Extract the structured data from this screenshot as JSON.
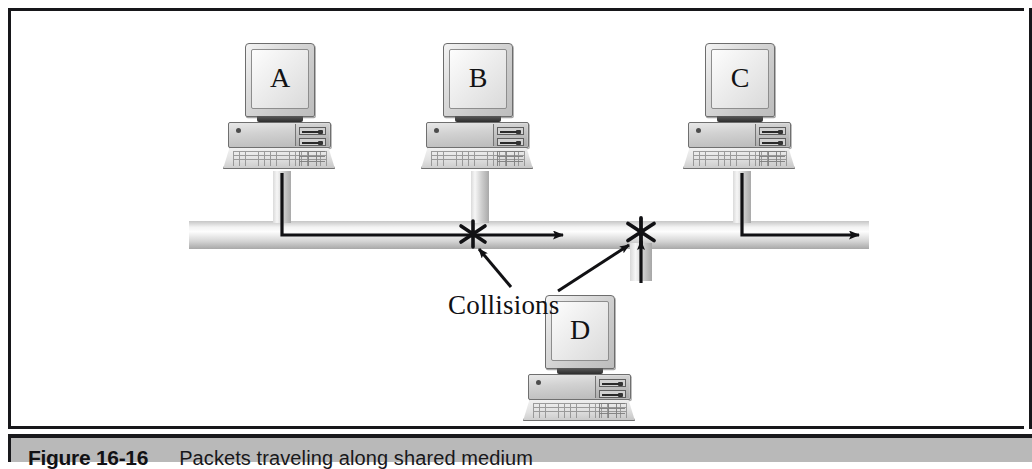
{
  "figure": {
    "caption_number": "Figure 16-16",
    "caption_text": "Packets traveling along shared medium",
    "frame_border_color": "#17171a",
    "caption_band_color": "#b9b9b9"
  },
  "diagram": {
    "title_label": "Collisions",
    "bus_label": "shared medium bus",
    "workstations": [
      {
        "id": "A",
        "screen_letter": "A",
        "x": 212,
        "y": 32,
        "orientation": "upright"
      },
      {
        "id": "B",
        "screen_letter": "B",
        "x": 410,
        "y": 32,
        "orientation": "upright"
      },
      {
        "id": "C",
        "screen_letter": "C",
        "x": 672,
        "y": 32,
        "orientation": "upright"
      },
      {
        "id": "D",
        "screen_letter": "D",
        "x": 512,
        "y": 266,
        "orientation": "inverted"
      }
    ],
    "drop_cables": [
      {
        "for": "A",
        "x": 262,
        "y": 160,
        "height": 52
      },
      {
        "for": "B",
        "x": 460,
        "y": 160,
        "height": 52
      },
      {
        "for": "C",
        "x": 722,
        "y": 160,
        "height": 52
      },
      {
        "for": "D",
        "x": 619,
        "y": 232,
        "height": 38
      }
    ],
    "collision_markers": [
      {
        "name": "collision-star-1",
        "x": 462,
        "y": 222
      },
      {
        "name": "collision-star-2",
        "x": 630,
        "y": 220
      }
    ],
    "packet_paths": [
      {
        "from": "A",
        "description": "down drop cable then right along bus"
      },
      {
        "from": "C",
        "description": "down drop cable then right to bus end"
      },
      {
        "from": "D",
        "description": "up drop cable into bus"
      }
    ],
    "arrowheads": [
      {
        "name": "arrow-bus-mid",
        "x": 560,
        "y": 224,
        "direction": "right"
      },
      {
        "name": "arrow-bus-end",
        "x": 856,
        "y": 224,
        "direction": "right"
      },
      {
        "name": "arrow-up-d",
        "x": 630,
        "y": 228,
        "direction": "up"
      }
    ],
    "leader_arrows": [
      {
        "name": "leader-to-collision-1",
        "from_x": 500,
        "from_y": 276,
        "to_x": 464,
        "to_y": 236
      },
      {
        "name": "leader-to-collision-2",
        "from_x": 545,
        "from_y": 278,
        "to_x": 620,
        "to_y": 232
      }
    ],
    "colors": {
      "ink": "#111114",
      "bus_highlight": "#fdfdfd",
      "bus_shadow": "#a8a8a8",
      "monitor_face": "#e0e0e0"
    }
  }
}
